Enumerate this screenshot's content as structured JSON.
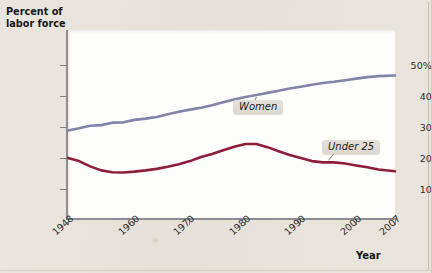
{
  "figure": {
    "background_color": "#e7e3da",
    "plot_background_color": "#fdfdfc"
  },
  "axes": {
    "y_title_line1": "Percent of",
    "y_title_line2": "labor force",
    "x_title": "Year",
    "y_ticks": [
      "50%",
      "40",
      "30",
      "20",
      "10"
    ],
    "x_ticks": [
      "1948",
      "1960",
      "1970",
      "1980",
      "1990",
      "2000",
      "2007"
    ]
  },
  "labels": {
    "women": "Women",
    "under25": "Under 25"
  },
  "chart_data": {
    "type": "line",
    "title": "",
    "subtitle": "",
    "xlabel": "Year",
    "ylabel": "Percent of labor force",
    "xlim": [
      1948,
      2007
    ],
    "ylim": [
      0,
      55
    ],
    "yticks": [
      10,
      20,
      30,
      40,
      50
    ],
    "ytick_labels": [
      "10",
      "20",
      "30",
      "40",
      "50%"
    ],
    "xticks": [
      1948,
      1960,
      1970,
      1980,
      1990,
      2000,
      2007
    ],
    "grid": false,
    "legend": "inline-annotations",
    "series": [
      {
        "name": "Women",
        "color": "#8183a8",
        "x": [
          1948,
          1950,
          1952,
          1954,
          1956,
          1958,
          1960,
          1962,
          1964,
          1966,
          1968,
          1970,
          1972,
          1974,
          1976,
          1978,
          1980,
          1982,
          1984,
          1986,
          1988,
          1990,
          1992,
          1994,
          1996,
          1998,
          2000,
          2002,
          2004,
          2007
        ],
        "values": [
          28.9,
          29.6,
          30.4,
          30.6,
          31.4,
          31.5,
          32.3,
          32.7,
          33.2,
          34.1,
          34.9,
          35.6,
          36.2,
          37.0,
          38.0,
          38.9,
          39.7,
          40.3,
          41.0,
          41.7,
          42.4,
          43.0,
          43.6,
          44.2,
          44.6,
          45.1,
          45.6,
          46.1,
          46.4,
          46.6
        ]
      },
      {
        "name": "Under 25",
        "color": "#8e1d37",
        "x": [
          1948,
          1950,
          1952,
          1954,
          1956,
          1958,
          1960,
          1962,
          1964,
          1966,
          1968,
          1970,
          1972,
          1974,
          1976,
          1978,
          1980,
          1982,
          1984,
          1986,
          1988,
          1990,
          1992,
          1994,
          1996,
          1998,
          2000,
          2002,
          2004,
          2007
        ],
        "values": [
          20.0,
          19.0,
          17.3,
          16.0,
          15.4,
          15.3,
          15.6,
          16.0,
          16.5,
          17.2,
          18.0,
          19.0,
          20.3,
          21.3,
          22.5,
          23.6,
          24.5,
          24.5,
          23.5,
          22.2,
          21.0,
          20.0,
          19.0,
          18.6,
          18.6,
          18.2,
          17.6,
          17.0,
          16.3,
          15.7
        ]
      }
    ],
    "annotations": [
      {
        "text": "Women",
        "attached_series": "Women",
        "x": 1984,
        "y": 36
      },
      {
        "text": "Under 25",
        "attached_series": "Under 25",
        "x": 1997,
        "y": 22
      }
    ]
  }
}
